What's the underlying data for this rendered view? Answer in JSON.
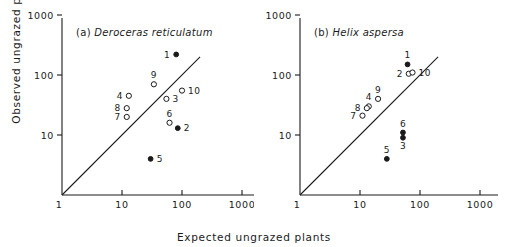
{
  "figure": {
    "xlabel": "Expected ungrazed plants",
    "ylabel": "Observed ungrazed plants"
  },
  "panels": [
    {
      "id": "a",
      "tag": "(a)",
      "species": "Deroceras reticulatum"
    },
    {
      "id": "b",
      "tag": "(b)",
      "species": "Helix aspersa"
    }
  ],
  "axis": {
    "x_ticks": [
      "1",
      "10",
      "100",
      "1000"
    ],
    "y_ticks": [
      "10",
      "100",
      "1000"
    ]
  },
  "chart_data": {
    "type": "scatter",
    "xlabel": "Expected ungrazed plants",
    "ylabel": "Observed ungrazed plants",
    "xscale": "log",
    "yscale": "log",
    "xlim": [
      1,
      1000
    ],
    "ylim": [
      1,
      1000
    ],
    "x_ticks": [
      1,
      10,
      100,
      1000
    ],
    "y_ticks": [
      1,
      10,
      100,
      1000
    ],
    "grid": false,
    "legend": null,
    "reference_line": {
      "label": "1:1 line",
      "from": [
        1,
        1
      ],
      "to": [
        200,
        200
      ]
    },
    "marker_types": {
      "open": "open circle",
      "filled": "filled circle"
    },
    "panels": [
      {
        "panel": "a",
        "tag": "(a)",
        "species": "Deroceras reticulatum",
        "points": [
          {
            "label": "1",
            "x": 80,
            "y": 220,
            "marker": "filled",
            "label_pos": "left"
          },
          {
            "label": "2",
            "x": 85,
            "y": 13,
            "marker": "filled",
            "label_pos": "right"
          },
          {
            "label": "3",
            "x": 55,
            "y": 40,
            "marker": "open",
            "label_pos": "right"
          },
          {
            "label": "4",
            "x": 13,
            "y": 45,
            "marker": "open",
            "label_pos": "left"
          },
          {
            "label": "5",
            "x": 30,
            "y": 4,
            "marker": "filled",
            "label_pos": "right"
          },
          {
            "label": "6",
            "x": 62,
            "y": 16,
            "marker": "open",
            "label_pos": "top"
          },
          {
            "label": "7",
            "x": 12,
            "y": 20,
            "marker": "open",
            "label_pos": "left"
          },
          {
            "label": "8",
            "x": 12,
            "y": 28,
            "marker": "open",
            "label_pos": "left"
          },
          {
            "label": "9",
            "x": 34,
            "y": 70,
            "marker": "open",
            "label_pos": "top"
          },
          {
            "label": "10",
            "x": 100,
            "y": 55,
            "marker": "open",
            "label_pos": "right"
          }
        ]
      },
      {
        "panel": "b",
        "tag": "(b)",
        "species": "Helix aspersa",
        "points": [
          {
            "label": "1",
            "x": 62,
            "y": 150,
            "marker": "filled",
            "label_pos": "top"
          },
          {
            "label": "2",
            "x": 65,
            "y": 105,
            "marker": "open",
            "label_pos": "left"
          },
          {
            "label": "3",
            "x": 52,
            "y": 9,
            "marker": "filled",
            "label_pos": "bottom"
          },
          {
            "label": "4",
            "x": 14,
            "y": 30,
            "marker": "open",
            "label_pos": "top"
          },
          {
            "label": "5",
            "x": 28,
            "y": 4,
            "marker": "filled",
            "label_pos": "top"
          },
          {
            "label": "6",
            "x": 52,
            "y": 11,
            "marker": "filled",
            "label_pos": "top"
          },
          {
            "label": "7",
            "x": 11,
            "y": 21,
            "marker": "open",
            "label_pos": "left"
          },
          {
            "label": "8",
            "x": 13,
            "y": 28,
            "marker": "open",
            "label_pos": "left"
          },
          {
            "label": "9",
            "x": 20,
            "y": 40,
            "marker": "open",
            "label_pos": "top"
          },
          {
            "label": "10",
            "x": 75,
            "y": 110,
            "marker": "open",
            "label_pos": "right"
          }
        ]
      }
    ]
  }
}
